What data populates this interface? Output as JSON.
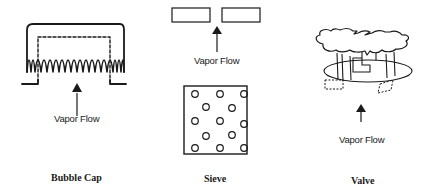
{
  "diagram": {
    "panels": [
      {
        "id": "bubble-cap",
        "caption": "Bubble Cap",
        "flow_label": "Vapor Flow"
      },
      {
        "id": "sieve",
        "caption": "Sieve",
        "flow_label": "Vapor Flow",
        "hole_grid": {
          "rows": 5,
          "pattern": "staggered 3-2-3-2-3",
          "hole_count": 13
        }
      },
      {
        "id": "valve",
        "caption": "Valve",
        "flow_label": "Vapor Flow"
      }
    ],
    "colors": {
      "line": "#1a1a1a",
      "background": "#ffffff"
    }
  }
}
